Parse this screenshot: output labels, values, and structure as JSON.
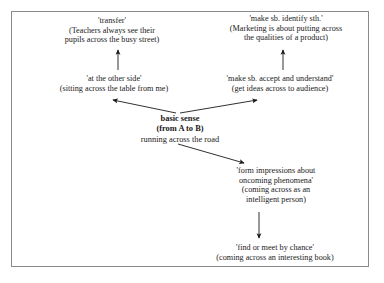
{
  "diagram": {
    "type": "semantic-network",
    "title": "basic sense (from A to B)",
    "frame": {
      "border_color": "#8a8a8a",
      "background": "#ffffff"
    },
    "text_color": "#1a1a1a",
    "nodes": [
      {
        "id": "transfer",
        "lines": [
          "'transfer'",
          "(Teachers always see their",
          "pupils across the busy street)"
        ]
      },
      {
        "id": "identify",
        "lines": [
          "'make sb. identify sth.'",
          "(Marketing is about putting across",
          "the qualities of a product)"
        ]
      },
      {
        "id": "other_side",
        "lines": [
          "'at the other side'",
          "(sitting across the table from me)"
        ]
      },
      {
        "id": "accept",
        "lines": [
          "'make sb. accept and understand'",
          "(get ideas across to audience)"
        ]
      },
      {
        "id": "basic_sense",
        "lines": [
          "basic sense",
          "(from A to B)",
          "running across the road"
        ]
      },
      {
        "id": "impressions",
        "lines": [
          "'form impressions about",
          "oncoming phenomena'",
          "(coming across as an",
          "intelligent person)"
        ]
      },
      {
        "id": "find_meet",
        "lines": [
          "'find or meet by chance'",
          "(coming across an interesting book)"
        ]
      }
    ],
    "arrows": [
      {
        "id": "other-side-to-transfer",
        "from": "other_side",
        "to": "transfer",
        "direction": "up"
      },
      {
        "id": "accept-to-identify",
        "from": "accept",
        "to": "identify",
        "direction": "up"
      },
      {
        "id": "basic-to-other-side",
        "from": "basic_sense",
        "to": "other_side",
        "direction": "up-left"
      },
      {
        "id": "basic-to-accept",
        "from": "basic_sense",
        "to": "accept",
        "direction": "up-right"
      },
      {
        "id": "basic-to-impressions",
        "from": "basic_sense",
        "to": "impressions",
        "direction": "down-right"
      },
      {
        "id": "impressions-to-find-meet",
        "from": "impressions",
        "to": "find_meet",
        "direction": "down"
      }
    ]
  }
}
